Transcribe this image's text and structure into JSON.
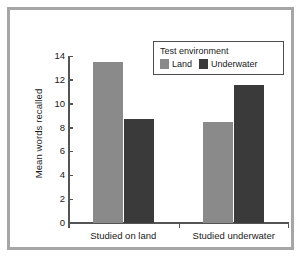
{
  "chart_data": {
    "type": "bar",
    "title": "",
    "xlabel": "",
    "ylabel": "Mean words recalled",
    "categories": [
      "Studied on land",
      "Studied underwater"
    ],
    "series": [
      {
        "name": "Land",
        "color": "#8a8a8a",
        "values": [
          13.5,
          8.5
        ]
      },
      {
        "name": "Underwater",
        "color": "#3a3a3a",
        "values": [
          8.7,
          11.6
        ]
      }
    ],
    "legend": {
      "title": "Test environment",
      "position": "top-right",
      "entries": [
        "Land",
        "Underwater"
      ]
    },
    "ylim": [
      0,
      14
    ],
    "yticks": [
      0,
      2,
      4,
      6,
      8,
      10,
      12,
      14
    ],
    "ytick_labels": [
      "0",
      "2",
      "4",
      "6",
      "8",
      "10",
      "12",
      "14"
    ],
    "grid": false,
    "frame_color": "#a6a6a6",
    "axis_color": "#555555"
  }
}
